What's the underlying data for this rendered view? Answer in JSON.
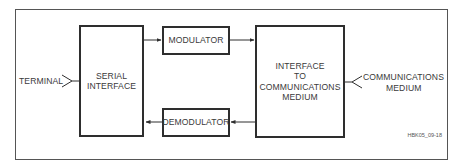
{
  "diagram": {
    "type": "block-diagram",
    "blocks": {
      "serial_interface": {
        "line1": "SERIAL",
        "line2": "INTERFACE"
      },
      "modulator": {
        "label": "MODULATOR"
      },
      "demodulator": {
        "label": "DEMODULATOR"
      },
      "comm_interface": {
        "line1": "INTERFACE",
        "line2": "TO",
        "line3": "COMMUNICATIONS",
        "line4": "MEDIUM"
      }
    },
    "external": {
      "terminal": "TERMINAL",
      "medium_line1": "COMMUNICATIONS",
      "medium_line2": "MEDIUM"
    },
    "figure_id": "HBK05_09-18",
    "connections": [
      {
        "from": "serial_interface",
        "to": "modulator"
      },
      {
        "from": "modulator",
        "to": "comm_interface"
      },
      {
        "from": "comm_interface",
        "to": "demodulator"
      },
      {
        "from": "demodulator",
        "to": "serial_interface"
      },
      {
        "from": "terminal",
        "to": "serial_interface"
      },
      {
        "from": "communications_medium",
        "to": "comm_interface"
      }
    ],
    "colors": {
      "line": "#2e2e2e",
      "text": "#3a3a3a"
    }
  }
}
